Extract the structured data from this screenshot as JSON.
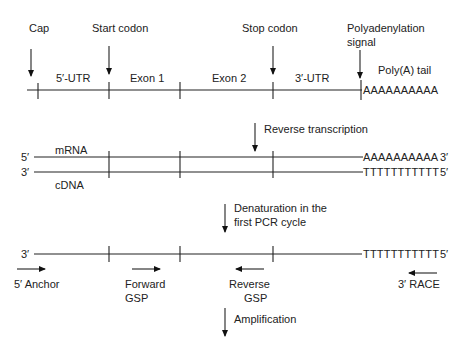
{
  "diagram": {
    "panel1": {
      "markers": {
        "cap": "Cap",
        "start_codon": "Start codon",
        "stop_codon": "Stop codon",
        "polyadenylation_signal_line1": "Polyadenylation",
        "polyadenylation_signal_line2": "signal"
      },
      "regions": {
        "utr5": "5′-UTR",
        "exon1": "Exon 1",
        "exon2": "Exon 2",
        "utr3": "3′-UTR",
        "polya_tail": "Poly(A) tail"
      },
      "polya_sequence": "AAAAAAAAAA"
    },
    "step1": {
      "label": "Reverse transcription"
    },
    "panel2": {
      "mrna_label": "mRNA",
      "cdna_label": "cDNA",
      "mrna_left_end": "5′",
      "mrna_right_end": "3′",
      "cdna_left_end": "3′",
      "cdna_right_end": "5′",
      "mrna_tail": "AAAAAAAAAA",
      "cdna_tail": "TTTTTTTTTTT"
    },
    "step2": {
      "label_line1": "Denaturation in the",
      "label_line2": "first PCR cycle"
    },
    "panel3": {
      "left_end": "3′",
      "right_end": "5′",
      "tail": "TTTTTTTTTTT",
      "primers": {
        "anchor5": "5′ Anchor",
        "forward_line1": "Forward",
        "forward_line2": "GSP",
        "reverse_line1": "Reverse",
        "reverse_line2": "GSP",
        "race3": "3′ RACE"
      }
    },
    "step3": {
      "label": "Amplification"
    }
  }
}
